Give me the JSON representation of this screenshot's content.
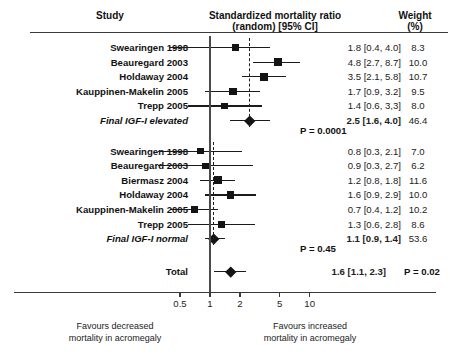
{
  "header": {
    "study": "Study",
    "smr_line1": "Standardized mortality ratio",
    "smr_line2": "(random) [95% CI]",
    "weight_line1": "Weight",
    "weight_line2": "(%)"
  },
  "axis": {
    "ticks": [
      {
        "label": "0.5",
        "value": 0.5
      },
      {
        "label": "1",
        "value": 1
      },
      {
        "label": "2",
        "value": 2
      },
      {
        "label": "5",
        "value": 5
      },
      {
        "label": "10",
        "value": 10
      }
    ],
    "footnote_left_line1": "Favours decreased",
    "footnote_left_line2": "mortality in acromegaly",
    "footnote_right_line1": "Favours increased",
    "footnote_right_line2": "mortality in acromegaly",
    "null_line_value": 1
  },
  "chart_data": {
    "type": "forest",
    "title": "Standardized mortality ratio (random) [95% CI]",
    "xlabel": "Standardized mortality ratio",
    "ylabel": "Study",
    "scale": "log",
    "xlim": [
      0.28,
      13.5
    ],
    "null_value": 1,
    "groups": [
      {
        "name": "Final IGF-I elevated",
        "reference_line": 2.5,
        "studies": [
          {
            "label": "Swearingen 1998",
            "estimate": 1.8,
            "ci_low": 0.4,
            "ci_high": 4.0,
            "weight": 8.3,
            "value_text": "1.8 [0.4, 4.0]",
            "weight_text": "8.3"
          },
          {
            "label": "Beauregard 2003",
            "estimate": 4.8,
            "ci_low": 2.7,
            "ci_high": 8.7,
            "weight": 10.0,
            "value_text": "4.8 [2.7, 8.7]",
            "weight_text": "10.0"
          },
          {
            "label": "Holdaway 2004",
            "estimate": 3.5,
            "ci_low": 2.1,
            "ci_high": 5.8,
            "weight": 10.7,
            "value_text": "3.5 [2.1, 5.8]",
            "weight_text": "10.7"
          },
          {
            "label": "Kauppinen-Makelin 2005",
            "estimate": 1.7,
            "ci_low": 0.9,
            "ci_high": 3.2,
            "weight": 9.5,
            "value_text": "1.7 [0.9, 3.2]",
            "weight_text": "9.5"
          },
          {
            "label": "Trepp 2005",
            "estimate": 1.4,
            "ci_low": 0.6,
            "ci_high": 3.3,
            "weight": 8.0,
            "value_text": "1.4 [0.6, 3,3]",
            "weight_text": "8.0"
          }
        ],
        "summary": {
          "label": "Final IGF-I elevated",
          "estimate": 2.5,
          "ci_low": 1.6,
          "ci_high": 4.0,
          "weight": 46.4,
          "value_text": "2.5 [1.6, 4.0]",
          "weight_text": "46.4",
          "p_text": "P = 0.0001"
        }
      },
      {
        "name": "Final IGF-I normal",
        "reference_line": 1.1,
        "studies": [
          {
            "label": "Swearingen 1998",
            "estimate": 0.8,
            "ci_low": 0.3,
            "ci_high": 2.1,
            "weight": 7.0,
            "value_text": "0.8 [0.3, 2.1]",
            "weight_text": "7.0"
          },
          {
            "label": "Beauregard 2003",
            "estimate": 0.9,
            "ci_low": 0.3,
            "ci_high": 2.7,
            "weight": 6.2,
            "value_text": "0.9 [0.3, 2.7]",
            "weight_text": "6.2"
          },
          {
            "label": "Biermasz  2004",
            "estimate": 1.2,
            "ci_low": 0.8,
            "ci_high": 1.8,
            "weight": 11.6,
            "value_text": "1.2 [0.8, 1.8]",
            "weight_text": "11.6"
          },
          {
            "label": "Holdaway 2004",
            "estimate": 1.6,
            "ci_low": 0.9,
            "ci_high": 2.9,
            "weight": 10.0,
            "value_text": "1.6 [0.9, 2.9]",
            "weight_text": "10.0"
          },
          {
            "label": "Kauppinen-Makelin 2005",
            "estimate": 0.7,
            "ci_low": 0.4,
            "ci_high": 1.2,
            "weight": 10.2,
            "value_text": "0.7 [0.4, 1.2]",
            "weight_text": "10.2"
          },
          {
            "label": "Trepp 2005",
            "estimate": 1.3,
            "ci_low": 0.6,
            "ci_high": 2.8,
            "weight": 8.6,
            "value_text": "1.3 [0.6, 2.8]",
            "weight_text": "8.6"
          }
        ],
        "summary": {
          "label": "Final IGF-I normal",
          "estimate": 1.1,
          "ci_low": 0.9,
          "ci_high": 1.4,
          "weight": 53.6,
          "value_text": "1.1 [0.9, 1.4]",
          "weight_text": "53.6",
          "p_text": "P = 0.45"
        }
      }
    ],
    "total": {
      "label": "Total",
      "estimate": 1.6,
      "ci_low": 1.1,
      "ci_high": 2.3,
      "value_text": "1.6 [1.1, 2.3]",
      "p_text": "P = 0.02"
    }
  }
}
